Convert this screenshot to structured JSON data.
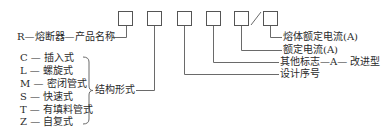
{
  "diagram": {
    "boxes": [
      "",
      "",
      "",
      "",
      "",
      ""
    ],
    "slash": "/",
    "product": {
      "code": "R",
      "dash1": "—",
      "name": "熔断器",
      "dash2": "—",
      "meaning": "产品名称"
    },
    "structure": {
      "label": "结构形式",
      "items": [
        {
          "code": "C",
          "dash": "—",
          "name": "插入式"
        },
        {
          "code": "L",
          "dash": "—",
          "name": "螺旋式"
        },
        {
          "code": "M",
          "dash": "—",
          "name": "密闭管式"
        },
        {
          "code": "S",
          "dash": "—",
          "name": "快速式"
        },
        {
          "code": "T",
          "dash": "—",
          "name": "有填料管式"
        },
        {
          "code": "Z",
          "dash": "—",
          "name": "自复式"
        }
      ]
    },
    "right_labels": {
      "fuse_rated_current": "熔体额定电流(A)",
      "rated_current": "额定电流(A)",
      "other_mark": "其他标志",
      "other_mark_code": "A",
      "other_mark_meaning": "改进型",
      "design_number": "设计序号"
    },
    "colors": {
      "line": "#666666",
      "text": "#2a2a2a"
    }
  }
}
